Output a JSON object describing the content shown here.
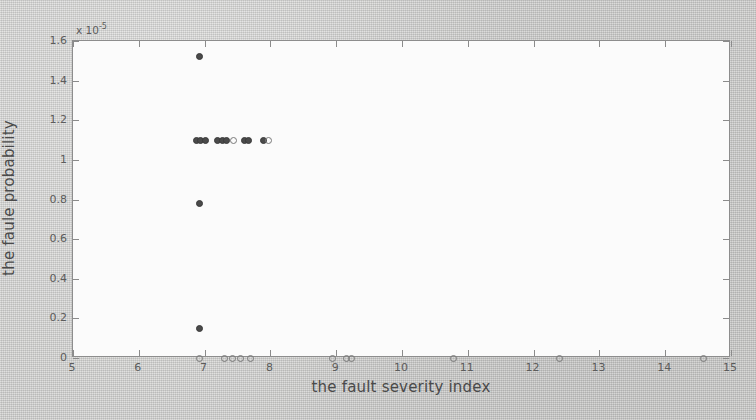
{
  "chart_data": {
    "type": "scatter",
    "title": "",
    "xlabel": "the fault severity index",
    "ylabel": "the faule probability",
    "y_exponent_label": "x 10",
    "y_exponent_power": "-5",
    "xlim": [
      5,
      15
    ],
    "ylim": [
      0,
      1.6
    ],
    "grid": false,
    "legend": null,
    "xticks": [
      "5",
      "6",
      "7",
      "8",
      "9",
      "10",
      "11",
      "12",
      "13",
      "14",
      "15"
    ],
    "xtick_values": [
      5,
      6,
      7,
      8,
      9,
      10,
      11,
      12,
      13,
      14,
      15
    ],
    "yticks": [
      "0",
      "0.2",
      "0.4",
      "0.6",
      "0.8",
      "1",
      "1.2",
      "1.4",
      "1.6"
    ],
    "ytick_values": [
      0,
      0.2,
      0.4,
      0.6,
      0.8,
      1,
      1.2,
      1.4,
      1.6
    ],
    "y_units": "1e-5",
    "marker": "circle",
    "marker_color": "#4a4a4a",
    "points": [
      {
        "x": 6.92,
        "y": 1.52,
        "style": "filled"
      },
      {
        "x": 6.87,
        "y": 1.1,
        "style": "filled"
      },
      {
        "x": 6.94,
        "y": 1.1,
        "style": "filled"
      },
      {
        "x": 7.01,
        "y": 1.1,
        "style": "filled"
      },
      {
        "x": 7.2,
        "y": 1.1,
        "style": "filled"
      },
      {
        "x": 7.27,
        "y": 1.1,
        "style": "filled"
      },
      {
        "x": 7.34,
        "y": 1.1,
        "style": "filled"
      },
      {
        "x": 7.44,
        "y": 1.1,
        "style": "open"
      },
      {
        "x": 7.6,
        "y": 1.1,
        "style": "filled"
      },
      {
        "x": 7.67,
        "y": 1.1,
        "style": "filled"
      },
      {
        "x": 7.9,
        "y": 1.1,
        "style": "filled"
      },
      {
        "x": 7.97,
        "y": 1.1,
        "style": "open"
      },
      {
        "x": 6.92,
        "y": 0.78,
        "style": "filled"
      },
      {
        "x": 6.92,
        "y": 0.15,
        "style": "filled"
      },
      {
        "x": 6.93,
        "y": 0.0,
        "style": "open"
      },
      {
        "x": 7.3,
        "y": 0.0,
        "style": "open"
      },
      {
        "x": 7.42,
        "y": 0.0,
        "style": "open"
      },
      {
        "x": 7.55,
        "y": 0.0,
        "style": "open"
      },
      {
        "x": 7.7,
        "y": 0.0,
        "style": "open"
      },
      {
        "x": 8.95,
        "y": 0.0,
        "style": "open"
      },
      {
        "x": 9.15,
        "y": 0.0,
        "style": "open"
      },
      {
        "x": 9.24,
        "y": 0.0,
        "style": "open"
      },
      {
        "x": 10.78,
        "y": 0.0,
        "style": "open"
      },
      {
        "x": 12.4,
        "y": 0.0,
        "style": "open"
      },
      {
        "x": 14.58,
        "y": 0.0,
        "style": "open"
      }
    ]
  },
  "figure": {
    "background_color": "#c8c8c6",
    "plot_background_color": "#fbfbfb",
    "axis_color": "#8d8d8d"
  }
}
